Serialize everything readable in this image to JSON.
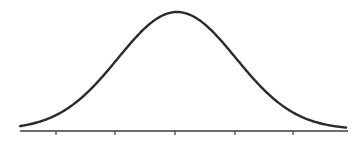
{
  "chart_data": {
    "type": "line",
    "title": "",
    "subtitle": "",
    "xlabel": "",
    "ylabel": "",
    "distribution": {
      "name": "normal",
      "mean": 0,
      "sd": 1
    },
    "x_ticks": [
      -2,
      -1,
      0,
      1,
      2
    ],
    "x_tick_labels": [],
    "xlim": [
      -2.65,
      2.95
    ],
    "ylim": [
      0,
      0.42
    ],
    "grid": false,
    "legend": null,
    "series": [
      {
        "name": "density",
        "color": "#2a2a2a"
      }
    ],
    "layout": {
      "baseline_y": 131,
      "axis_x_start": 20,
      "axis_x_end": 348,
      "peak_y": 12,
      "center_x": 177,
      "px_per_unit": 59,
      "tick_pixels": [
        56,
        115,
        175,
        235,
        293
      ]
    }
  }
}
